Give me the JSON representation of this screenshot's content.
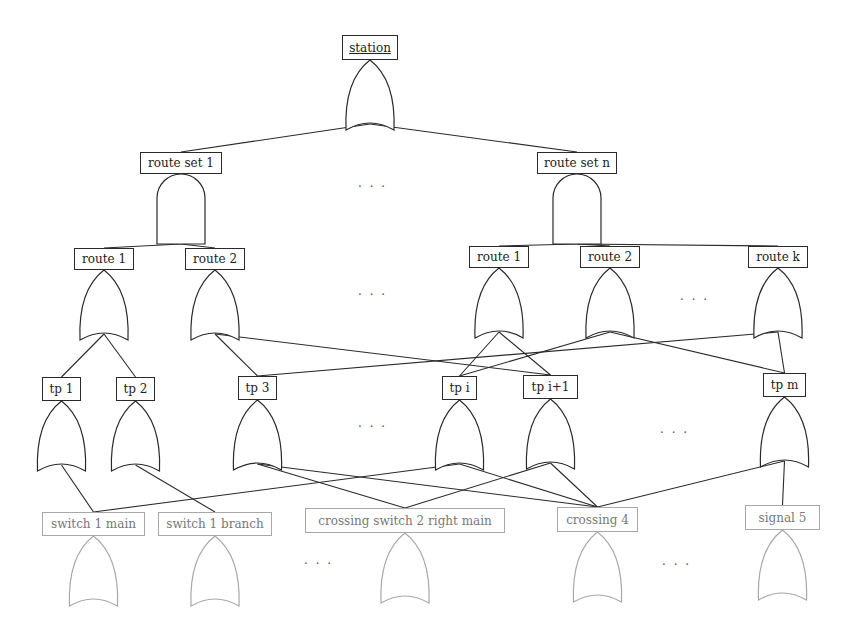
{
  "diagram": {
    "type": "fault-tree",
    "colors": {
      "line": "#2a2a2a",
      "gray": "#a8a8a8"
    },
    "nodes": [
      {
        "id": "station",
        "label": "station",
        "x": 342,
        "y": 35,
        "w": 56,
        "h": 25,
        "gate": "or",
        "style": "top"
      },
      {
        "id": "rs1",
        "label": "route set 1",
        "x": 140,
        "y": 152,
        "w": 82,
        "h": 22,
        "gate": "and"
      },
      {
        "id": "rsn",
        "label": "route set n",
        "x": 537,
        "y": 152,
        "w": 80,
        "h": 22,
        "gate": "and"
      },
      {
        "id": "r1a",
        "label": "route 1",
        "x": 74,
        "y": 248,
        "w": 60,
        "h": 22,
        "gate": "or"
      },
      {
        "id": "r2a",
        "label": "route 2",
        "x": 185,
        "y": 248,
        "w": 60,
        "h": 22,
        "gate": "or"
      },
      {
        "id": "r1b",
        "label": "route 1",
        "x": 469,
        "y": 246,
        "w": 60,
        "h": 22,
        "gate": "or"
      },
      {
        "id": "r2b",
        "label": "route 2",
        "x": 580,
        "y": 246,
        "w": 60,
        "h": 22,
        "gate": "or"
      },
      {
        "id": "rk",
        "label": "route k",
        "x": 748,
        "y": 246,
        "w": 60,
        "h": 22,
        "gate": "or"
      },
      {
        "id": "tp1",
        "label": "tp 1",
        "x": 42,
        "y": 377,
        "w": 39,
        "h": 24,
        "gate": "or"
      },
      {
        "id": "tp2",
        "label": "tp 2",
        "x": 116,
        "y": 377,
        "w": 39,
        "h": 24,
        "gate": "or"
      },
      {
        "id": "tp3",
        "label": "tp 3",
        "x": 238,
        "y": 376,
        "w": 39,
        "h": 24,
        "gate": "or"
      },
      {
        "id": "tpi",
        "label": "tp i",
        "x": 442,
        "y": 376,
        "w": 35,
        "h": 24,
        "gate": "or"
      },
      {
        "id": "tpi1",
        "label": "tp i+1",
        "x": 523,
        "y": 375,
        "w": 55,
        "h": 24,
        "gate": "or"
      },
      {
        "id": "tpm",
        "label": "tp m",
        "x": 763,
        "y": 373,
        "w": 43,
        "h": 24,
        "gate": "or"
      },
      {
        "id": "s1m",
        "label": "switch 1 main",
        "x": 42,
        "y": 512,
        "w": 103,
        "h": 24,
        "gate": "or",
        "style": "gray"
      },
      {
        "id": "s1b",
        "label": "switch 1 branch",
        "x": 158,
        "y": 512,
        "w": 114,
        "h": 24,
        "gate": "or",
        "style": "gray"
      },
      {
        "id": "cs2",
        "label": "crossing switch 2 right main",
        "x": 305,
        "y": 508,
        "w": 200,
        "h": 25,
        "gate": "or",
        "style": "gray"
      },
      {
        "id": "c4",
        "label": "crossing 4",
        "x": 557,
        "y": 507,
        "w": 81,
        "h": 25,
        "gate": "or",
        "style": "gray"
      },
      {
        "id": "sig5",
        "label": "signal 5",
        "x": 745,
        "y": 505,
        "w": 75,
        "h": 25,
        "gate": "or",
        "style": "gray"
      }
    ],
    "edges": [
      [
        "station",
        "rs1"
      ],
      [
        "station",
        "rsn"
      ],
      [
        "rs1",
        "r1a"
      ],
      [
        "rs1",
        "r2a"
      ],
      [
        "rsn",
        "r1b"
      ],
      [
        "rsn",
        "r2b"
      ],
      [
        "rsn",
        "rk"
      ],
      [
        "r1a",
        "tp1"
      ],
      [
        "r1a",
        "tp2"
      ],
      [
        "r2a",
        "tp3"
      ],
      [
        "r2a",
        "tpi1"
      ],
      [
        "r1b",
        "tpi"
      ],
      [
        "r1b",
        "tpi1"
      ],
      [
        "r2b",
        "tpi"
      ],
      [
        "r2b",
        "tpm"
      ],
      [
        "rk",
        "tp3"
      ],
      [
        "rk",
        "tpm"
      ],
      [
        "tp1",
        "s1m"
      ],
      [
        "tp2",
        "s1b"
      ],
      [
        "tp3",
        "cs2"
      ],
      [
        "tp3",
        "c4"
      ],
      [
        "tpi",
        "s1m"
      ],
      [
        "tpi",
        "c4"
      ],
      [
        "tpi1",
        "cs2"
      ],
      [
        "tpi1",
        "c4"
      ],
      [
        "tpm",
        "c4"
      ],
      [
        "tpm",
        "sig5"
      ]
    ],
    "ellipses": [
      {
        "label": "· · ·",
        "x": 358,
        "y": 180
      },
      {
        "label": "· · ·",
        "x": 358,
        "y": 288
      },
      {
        "label": "· · ·",
        "x": 680,
        "y": 293
      },
      {
        "label": "· · ·",
        "x": 358,
        "y": 420
      },
      {
        "label": "· · ·",
        "x": 660,
        "y": 426
      },
      {
        "label": "· · ·",
        "x": 304,
        "y": 557
      },
      {
        "label": "· · ·",
        "x": 662,
        "y": 558
      }
    ]
  }
}
